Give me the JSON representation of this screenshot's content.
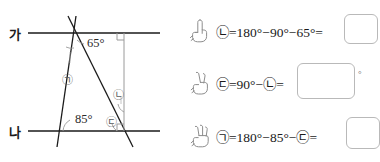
{
  "figure": {
    "line_top_label": "가",
    "line_bottom_label": "나",
    "angles": [
      {
        "id": "angle-65",
        "text": "65°"
      },
      {
        "id": "angle-85",
        "text": "85°"
      }
    ],
    "unknowns": [
      {
        "id": "unknown-a",
        "text": "㉠"
      },
      {
        "id": "unknown-b",
        "text": "㉡"
      },
      {
        "id": "unknown-c",
        "text": "㉢"
      }
    ],
    "stroke_color": "#1a1a1a",
    "thin_color": "#9a9a9a"
  },
  "steps": [
    {
      "hand_icon": "hand-one-finger-icon",
      "equation": "㉡=180°−90°−65°=",
      "answer_value": "",
      "has_degree_suffix": false
    },
    {
      "hand_icon": "hand-two-fingers-icon",
      "equation": "㉢=90°−㉡=",
      "answer_value": "",
      "has_degree_suffix": true,
      "degree_suffix": "°"
    },
    {
      "hand_icon": "hand-three-fingers-icon",
      "equation": "㉠=180°−85°−㉢=",
      "answer_value": "",
      "has_degree_suffix": false
    }
  ]
}
